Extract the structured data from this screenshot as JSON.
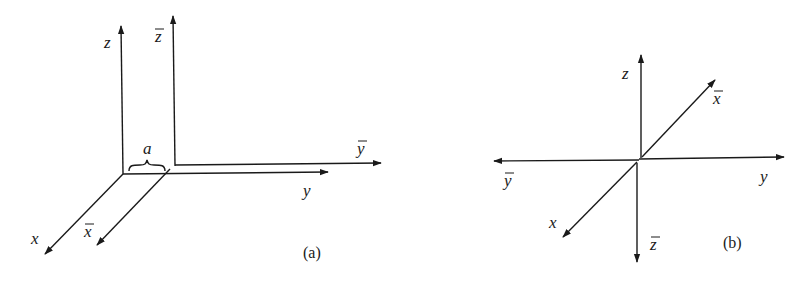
{
  "panels": [
    {
      "id": "a",
      "caption": "(a)",
      "description": "Two parallel coordinate frames offset by distance a along y-axis",
      "labels": {
        "z": "z",
        "z_bar": "z",
        "y": "y",
        "y_bar": "y",
        "x": "x",
        "x_bar": "x",
        "offset": "a"
      }
    },
    {
      "id": "b",
      "caption": "(b)",
      "description": "Coordinate frame with barred axes pointing opposite directions",
      "labels": {
        "z": "z",
        "z_bar": "z",
        "y": "y",
        "y_bar": "y",
        "x": "x",
        "x_bar": "x"
      }
    }
  ],
  "colors": {
    "ink": "#1a1a1a",
    "background": "#ffffff"
  }
}
